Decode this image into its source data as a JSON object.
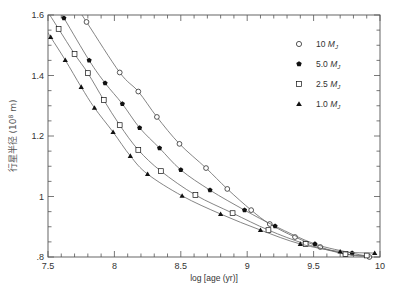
{
  "chart_data": {
    "type": "line",
    "title": "",
    "xlabel": "log [age (yr)]",
    "ylabel": "行星半径 (10^8 m)",
    "ylabel_parts": {
      "text": "行星半径",
      "unit": "(10",
      "exp": "8",
      "unit_tail": " m)"
    },
    "xlim": [
      7.5,
      10
    ],
    "ylim": [
      0.8,
      1.6
    ],
    "x_ticks": [
      7.5,
      8,
      8.5,
      9,
      9.5,
      10
    ],
    "x_tick_labels": [
      "7.5",
      "8",
      "8.5",
      "9",
      "9.5",
      "10"
    ],
    "y_ticks": [
      0.8,
      1.0,
      1.2,
      1.4,
      1.6
    ],
    "y_tick_labels": [
      ".8",
      "1",
      "1.2",
      "1.4",
      "1.6"
    ],
    "grid": false,
    "legend_position": "upper right",
    "series": [
      {
        "name": "10 MJ",
        "label_num": "10",
        "marker": "open-circle",
        "x": [
          7.79,
          8.04,
          8.18,
          8.32,
          8.49,
          8.69,
          8.85,
          9.03,
          9.17,
          9.36,
          9.55,
          9.74,
          9.92
        ],
        "y": [
          1.577,
          1.41,
          1.347,
          1.263,
          1.174,
          1.094,
          1.025,
          0.955,
          0.909,
          0.866,
          0.833,
          0.81,
          0.8
        ]
      },
      {
        "name": "5.0 MJ",
        "label_num": "5.0",
        "marker": "filled-pentagon",
        "x": [
          7.62,
          7.81,
          7.93,
          8.06,
          8.19,
          8.34,
          8.5,
          8.72,
          8.98,
          9.21,
          9.51,
          9.79,
          9.96
        ],
        "y": [
          1.59,
          1.45,
          1.375,
          1.306,
          1.227,
          1.16,
          1.088,
          1.021,
          0.955,
          0.902,
          0.843,
          0.813,
          0.797
        ]
      },
      {
        "name": "2.5 MJ",
        "label_num": "2.5",
        "marker": "open-square",
        "x": [
          7.58,
          7.7,
          7.8,
          7.92,
          8.04,
          8.18,
          8.35,
          8.61,
          8.89,
          9.16,
          9.44,
          9.74,
          9.9
        ],
        "y": [
          1.554,
          1.471,
          1.408,
          1.319,
          1.236,
          1.154,
          1.084,
          1.005,
          0.945,
          0.889,
          0.843,
          0.81,
          0.805
        ]
      },
      {
        "name": "1.0 MJ",
        "label_num": "1.0",
        "marker": "filled-triangle",
        "x": [
          7.52,
          7.63,
          7.75,
          7.85,
          7.99,
          8.12,
          8.25,
          8.51,
          8.8,
          9.1,
          9.4,
          9.7,
          9.96
        ],
        "y": [
          1.527,
          1.451,
          1.362,
          1.293,
          1.213,
          1.134,
          1.074,
          1.002,
          0.942,
          0.889,
          0.843,
          0.818,
          0.813
        ]
      }
    ]
  },
  "colors": {
    "line": "#666666",
    "marker": "#111111",
    "axis": "#555555"
  }
}
